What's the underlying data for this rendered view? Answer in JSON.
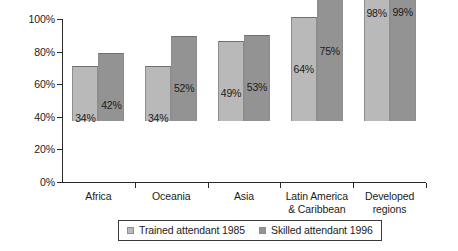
{
  "chart_data": {
    "type": "bar",
    "title": "",
    "xlabel": "",
    "ylabel": "",
    "ylim": [
      0,
      100
    ],
    "ytick_labels": [
      "0%",
      "20%",
      "40%",
      "60%",
      "80%",
      "100%"
    ],
    "ytick_values": [
      0,
      20,
      40,
      60,
      80,
      100
    ],
    "grid": false,
    "legend_position": "bottom",
    "categories": [
      "Africa",
      "Oceania",
      "Asia",
      "Latin America\n& Caribbean",
      "Developed\nregions"
    ],
    "series": [
      {
        "name": "Trained attendant 1985",
        "color": "#b9b9b9",
        "values": [
          34,
          34,
          49,
          64,
          98
        ],
        "data_labels": [
          "34%",
          "34%",
          "49%",
          "64%",
          "98%"
        ]
      },
      {
        "name": "Skilled attendant 1996",
        "color": "#939393",
        "values": [
          42,
          52,
          53,
          75,
          99
        ],
        "data_labels": [
          "42%",
          "52%",
          "53%",
          "75%",
          "99%"
        ]
      }
    ]
  },
  "legend": {
    "items": [
      {
        "label": "Trained attendant 1985"
      },
      {
        "label": "Skilled attendant 1996"
      }
    ]
  },
  "colors": {
    "series_1985": "#b9b9b9",
    "series_1996": "#939393",
    "axis": "#2a2a2a",
    "text": "#1b1b1b",
    "background": "#ffffff"
  }
}
